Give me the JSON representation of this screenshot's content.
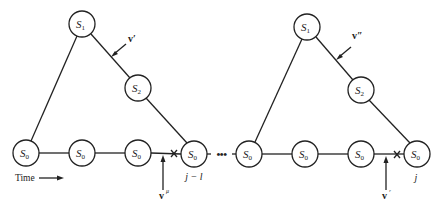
{
  "diagram": {
    "nodes": [
      {
        "id": "L_S1",
        "label": "S",
        "sub": "1",
        "x": 82,
        "y": 24
      },
      {
        "id": "L_S2",
        "label": "S",
        "sub": "2",
        "x": 138,
        "y": 88
      },
      {
        "id": "L_S0a",
        "label": "S",
        "sub": "0",
        "x": 26,
        "y": 153
      },
      {
        "id": "L_S0b",
        "label": "S",
        "sub": "0",
        "x": 82,
        "y": 153
      },
      {
        "id": "L_S0c",
        "label": "S",
        "sub": "0",
        "x": 138,
        "y": 153
      },
      {
        "id": "L_S0d",
        "label": "S",
        "sub": "0",
        "x": 194,
        "y": 154
      },
      {
        "id": "R_S1",
        "label": "S",
        "sub": "1",
        "x": 307,
        "y": 27
      },
      {
        "id": "R_S2",
        "label": "S",
        "sub": "2",
        "x": 361,
        "y": 90
      },
      {
        "id": "R_S0a",
        "label": "S",
        "sub": "0",
        "x": 249,
        "y": 154
      },
      {
        "id": "R_S0b",
        "label": "S",
        "sub": "0",
        "x": 305,
        "y": 154
      },
      {
        "id": "R_S0c",
        "label": "S",
        "sub": "0",
        "x": 361,
        "y": 154
      },
      {
        "id": "R_S0d",
        "label": "S",
        "sub": "0",
        "x": 417,
        "y": 154
      }
    ],
    "labels": {
      "v_prime": "v′",
      "v_double_prime": "v″",
      "v_mu_left": "v",
      "v_mu_left_sup": "μ",
      "v_mu_right": "v",
      "v_mu_right_sup": "ʳ",
      "index_left": "j − l",
      "index_right": "j",
      "time": "Time",
      "ellipsis": "•••"
    }
  }
}
